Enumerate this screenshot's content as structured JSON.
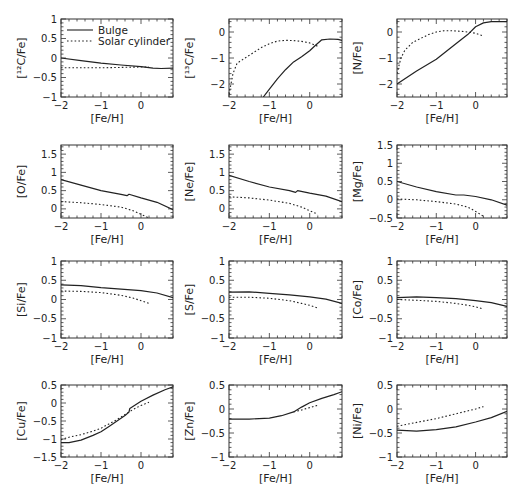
{
  "chart_data": {
    "type": "line",
    "layout": "4x3 grid of panels",
    "legend": {
      "placement": "top-left of first panel",
      "entries": [
        {
          "name": "Bulge",
          "style": "solid"
        },
        {
          "name": "Solar cylinder",
          "style": "dotted"
        }
      ]
    },
    "series_names": [
      "Bulge",
      "Solar cylinder"
    ],
    "panels": [
      {
        "id": "C12",
        "ylabel": "[¹²C/Fe]",
        "xlabel": "[Fe/H]",
        "xlim": [
          -2,
          0.8
        ],
        "ylim": [
          -1,
          1
        ],
        "xticks": [
          -2,
          -1,
          0
        ],
        "yticks": [
          -1,
          -0.5,
          0,
          0.5,
          1
        ],
        "ytick_labels": [
          "−1",
          "−0.5",
          "0",
          "0.5",
          "1"
        ],
        "has_legend": true,
        "series": [
          {
            "name": "Bulge",
            "x": [
              -2,
              -1.5,
              -1,
              -0.5,
              0,
              0.3,
              0.5,
              0.8
            ],
            "y": [
              0.0,
              -0.07,
              -0.13,
              -0.18,
              -0.22,
              -0.26,
              -0.27,
              -0.26
            ]
          },
          {
            "name": "Solar cylinder",
            "x": [
              -2,
              -1.5,
              -1,
              -0.5,
              0.0,
              0.2
            ],
            "y": [
              -0.25,
              -0.25,
              -0.25,
              -0.24,
              -0.23,
              -0.23
            ]
          }
        ]
      },
      {
        "id": "C13",
        "ylabel": "[¹³C/Fe]",
        "xlabel": "[Fe/H]",
        "xlim": [
          -2,
          0.8
        ],
        "ylim": [
          -2.5,
          0.5
        ],
        "xticks": [
          -2,
          -1,
          0
        ],
        "yticks": [
          -2,
          -1,
          0
        ],
        "ytick_labels": [
          "−2",
          "−1",
          "0"
        ],
        "series": [
          {
            "name": "Bulge",
            "x": [
              -1.15,
              -1.0,
              -0.8,
              -0.6,
              -0.4,
              -0.2,
              0.0,
              0.15,
              0.3,
              0.5,
              0.7,
              0.8
            ],
            "y": [
              -2.5,
              -2.2,
              -1.8,
              -1.45,
              -1.15,
              -0.95,
              -0.72,
              -0.5,
              -0.3,
              -0.27,
              -0.28,
              -0.32
            ]
          },
          {
            "name": "Solar cylinder",
            "x": [
              -2,
              -1.9,
              -1.8,
              -1.6,
              -1.4,
              -1.2,
              -1.0,
              -0.8,
              -0.6,
              -0.4,
              -0.2,
              0.0,
              0.2
            ],
            "y": [
              -2.4,
              -1.6,
              -1.2,
              -1.0,
              -0.8,
              -0.6,
              -0.45,
              -0.35,
              -0.32,
              -0.33,
              -0.36,
              -0.42,
              -0.55
            ]
          }
        ]
      },
      {
        "id": "N",
        "ylabel": "[N/Fe]",
        "xlabel": "[Fe/H]",
        "xlim": [
          -2,
          0.8
        ],
        "ylim": [
          -2.5,
          0.5
        ],
        "xticks": [
          -2,
          -1,
          0
        ],
        "yticks": [
          -2,
          -1,
          0
        ],
        "ytick_labels": [
          "−2",
          "−1",
          "0"
        ],
        "series": [
          {
            "name": "Bulge",
            "x": [
              -2,
              -1.5,
              -1.0,
              -0.5,
              -0.2,
              0.0,
              0.2,
              0.4,
              0.8
            ],
            "y": [
              -2.0,
              -1.5,
              -1.05,
              -0.45,
              -0.1,
              0.2,
              0.35,
              0.4,
              0.4
            ]
          },
          {
            "name": "Solar cylinder",
            "x": [
              -2,
              -1.9,
              -1.8,
              -1.6,
              -1.4,
              -1.2,
              -1.0,
              -0.8,
              -0.6,
              -0.4,
              -0.2,
              0.0,
              0.2
            ],
            "y": [
              -1.6,
              -1.0,
              -0.7,
              -0.4,
              -0.25,
              -0.1,
              0.0,
              0.05,
              0.05,
              0.03,
              0.0,
              -0.05,
              -0.15
            ]
          }
        ]
      },
      {
        "id": "O",
        "ylabel": "[O/Fe]",
        "xlabel": "[Fe/H]",
        "xlim": [
          -2,
          0.8
        ],
        "ylim": [
          -0.25,
          1.75
        ],
        "xticks": [
          -2,
          -1,
          0
        ],
        "yticks": [
          0,
          0.5,
          1,
          1.5
        ],
        "ytick_labels": [
          "0",
          "0.5",
          "1",
          "1.5"
        ],
        "series": [
          {
            "name": "Bulge",
            "x": [
              -2,
              -1.5,
              -1.0,
              -0.5,
              -0.35,
              -0.3,
              0.0,
              0.4,
              0.8
            ],
            "y": [
              0.8,
              0.65,
              0.5,
              0.4,
              0.36,
              0.4,
              0.3,
              0.18,
              -0.02
            ]
          },
          {
            "name": "Solar cylinder",
            "x": [
              -2,
              -1.5,
              -1.0,
              -0.5,
              -0.2,
              0.0,
              0.2
            ],
            "y": [
              0.2,
              0.17,
              0.12,
              0.05,
              -0.05,
              -0.15,
              -0.25
            ]
          }
        ]
      },
      {
        "id": "Ne",
        "ylabel": "[Ne/Fe]",
        "xlabel": "[Fe/H]",
        "xlim": [
          -2,
          0.8
        ],
        "ylim": [
          -0.25,
          1.75
        ],
        "xticks": [
          -2,
          -1,
          0
        ],
        "yticks": [
          0,
          0.5,
          1,
          1.5
        ],
        "ytick_labels": [
          "0",
          "0.5",
          "1",
          "1.5"
        ],
        "series": [
          {
            "name": "Bulge",
            "x": [
              -2,
              -1.5,
              -1.0,
              -0.5,
              -0.35,
              -0.3,
              0.0,
              0.4,
              0.8
            ],
            "y": [
              0.92,
              0.75,
              0.6,
              0.5,
              0.45,
              0.5,
              0.43,
              0.35,
              0.2
            ]
          },
          {
            "name": "Solar cylinder",
            "x": [
              -2,
              -1.5,
              -1.0,
              -0.5,
              -0.2,
              0.0,
              0.2
            ],
            "y": [
              0.33,
              0.3,
              0.24,
              0.15,
              0.05,
              -0.05,
              -0.15
            ]
          }
        ]
      },
      {
        "id": "Mg",
        "ylabel": "[Mg/Fe]",
        "xlabel": "[Fe/H]",
        "xlim": [
          -2,
          0.8
        ],
        "ylim": [
          -0.5,
          1.5
        ],
        "xticks": [
          -2,
          -1,
          0
        ],
        "yticks": [
          -0.5,
          0,
          0.5,
          1,
          1.5
        ],
        "ytick_labels": [
          "−0.5",
          "0",
          "0.5",
          "1",
          "1.5"
        ],
        "series": [
          {
            "name": "Bulge",
            "x": [
              -2,
              -1.5,
              -1.0,
              -0.5,
              -0.3,
              0.0,
              0.4,
              0.8
            ],
            "y": [
              0.5,
              0.35,
              0.22,
              0.13,
              0.13,
              0.09,
              0.0,
              -0.15
            ]
          },
          {
            "name": "Solar cylinder",
            "x": [
              -2,
              -1.5,
              -1.0,
              -0.5,
              -0.2,
              0.0,
              0.2
            ],
            "y": [
              0.02,
              0.0,
              -0.05,
              -0.12,
              -0.2,
              -0.32,
              -0.45
            ]
          }
        ]
      },
      {
        "id": "Si",
        "ylabel": "[Si/Fe]",
        "xlabel": "[Fe/H]",
        "xlim": [
          -2,
          0.8
        ],
        "ylim": [
          -1,
          1
        ],
        "xticks": [
          -2,
          -1,
          0
        ],
        "yticks": [
          -1,
          -0.5,
          0,
          0.5,
          1
        ],
        "ytick_labels": [
          "−1",
          "−0.5",
          "0",
          "0.5",
          "1"
        ],
        "series": [
          {
            "name": "Bulge",
            "x": [
              -2,
              -1.5,
              -1.0,
              -0.5,
              0.0,
              0.4,
              0.8
            ],
            "y": [
              0.38,
              0.36,
              0.31,
              0.27,
              0.23,
              0.17,
              0.05
            ]
          },
          {
            "name": "Solar cylinder",
            "x": [
              -2,
              -1.5,
              -1.0,
              -0.5,
              -0.2,
              0.0,
              0.2
            ],
            "y": [
              0.22,
              0.21,
              0.18,
              0.11,
              0.04,
              -0.03,
              -0.1
            ]
          }
        ]
      },
      {
        "id": "S",
        "ylabel": "[S/Fe]",
        "xlabel": "[Fe/H]",
        "xlim": [
          -2,
          0.8
        ],
        "ylim": [
          -1,
          1
        ],
        "xticks": [
          -2,
          -1,
          0
        ],
        "yticks": [
          -1,
          -0.5,
          0,
          0.5,
          1
        ],
        "ytick_labels": [
          "−1",
          "−0.5",
          "0",
          "0.5",
          "1"
        ],
        "series": [
          {
            "name": "Bulge",
            "x": [
              -2,
              -1.5,
              -1.0,
              -0.5,
              0.0,
              0.4,
              0.8
            ],
            "y": [
              0.19,
              0.2,
              0.16,
              0.12,
              0.07,
              0.01,
              -0.1
            ]
          },
          {
            "name": "Solar cylinder",
            "x": [
              -2,
              -1.5,
              -1.0,
              -0.5,
              -0.2,
              0.0,
              0.2
            ],
            "y": [
              0.06,
              0.06,
              0.03,
              -0.03,
              -0.1,
              -0.15,
              -0.22
            ]
          }
        ]
      },
      {
        "id": "Co",
        "ylabel": "[Co/Fe]",
        "xlabel": "[Fe/H]",
        "xlim": [
          -2,
          0.8
        ],
        "ylim": [
          -1,
          1
        ],
        "xticks": [
          -2,
          -1,
          0
        ],
        "yticks": [
          -1,
          -0.5,
          0,
          0.5,
          1
        ],
        "ytick_labels": [
          "−1",
          "−0.5",
          "0",
          "0.5",
          "1"
        ],
        "series": [
          {
            "name": "Bulge",
            "x": [
              -2,
              -1.5,
              -1.0,
              -0.5,
              0.0,
              0.4,
              0.8
            ],
            "y": [
              0.05,
              0.07,
              0.05,
              0.02,
              -0.03,
              -0.08,
              -0.18
            ]
          },
          {
            "name": "Solar cylinder",
            "x": [
              -2,
              -1.5,
              -1.0,
              -0.5,
              -0.2,
              0.0,
              0.2
            ],
            "y": [
              0.0,
              -0.02,
              -0.05,
              -0.1,
              -0.15,
              -0.19,
              -0.25
            ]
          }
        ]
      },
      {
        "id": "Cu",
        "ylabel": "[Cu/Fe]",
        "xlabel": "[Fe/H]",
        "xlim": [
          -2,
          0.8
        ],
        "ylim": [
          -1.5,
          0.5
        ],
        "xticks": [
          -2,
          -1,
          0
        ],
        "yticks": [
          -1.5,
          -1,
          -0.5,
          0,
          0.5
        ],
        "ytick_labels": [
          "−1.5",
          "−1",
          "−0.5",
          "0",
          "0.5"
        ],
        "series": [
          {
            "name": "Bulge",
            "x": [
              -2,
              -1.8,
              -1.5,
              -1.2,
              -1.0,
              -0.8,
              -0.6,
              -0.4,
              -0.3,
              -0.28,
              0.0,
              0.3,
              0.6,
              0.8
            ],
            "y": [
              -1.1,
              -1.1,
              -1.03,
              -0.9,
              -0.8,
              -0.65,
              -0.5,
              -0.35,
              -0.25,
              -0.15,
              0.05,
              0.22,
              0.37,
              0.45
            ]
          },
          {
            "name": "Solar cylinder",
            "x": [
              -2,
              -1.8,
              -1.5,
              -1.2,
              -1.0,
              -0.8,
              -0.6,
              -0.4,
              -0.2,
              0.0,
              0.2
            ],
            "y": [
              -1.02,
              -0.95,
              -0.88,
              -0.78,
              -0.7,
              -0.58,
              -0.46,
              -0.32,
              -0.18,
              -0.07,
              0.02
            ]
          }
        ]
      },
      {
        "id": "Zn",
        "ylabel": "[Zn/Fe]",
        "xlabel": "[Fe/H]",
        "xlim": [
          -2,
          0.8
        ],
        "ylim": [
          -1,
          0.5
        ],
        "xticks": [
          -2,
          -1,
          0
        ],
        "yticks": [
          -1,
          -0.5,
          0,
          0.5
        ],
        "ytick_labels": [
          "−1",
          "−0.5",
          "0",
          "0.5"
        ],
        "series": [
          {
            "name": "Bulge",
            "x": [
              -2,
              -1.5,
              -1.0,
              -0.7,
              -0.4,
              -0.2,
              0.0,
              0.3,
              0.6,
              0.8
            ],
            "y": [
              -0.21,
              -0.21,
              -0.19,
              -0.14,
              -0.06,
              0.04,
              0.13,
              0.22,
              0.3,
              0.36
            ]
          },
          {
            "name": "Solar cylinder",
            "x": [
              -0.4,
              -0.2,
              0.0,
              0.2
            ],
            "y": [
              -0.06,
              -0.02,
              0.03,
              0.08
            ]
          }
        ]
      },
      {
        "id": "Ni",
        "ylabel": "[Ni/Fe]",
        "xlabel": "[Fe/H]",
        "xlim": [
          -2,
          0.8
        ],
        "ylim": [
          -1,
          0.5
        ],
        "xticks": [
          -2,
          -1,
          0
        ],
        "yticks": [
          -1,
          -0.5,
          0,
          0.5
        ],
        "ytick_labels": [
          "−1",
          "−0.5",
          "0",
          "0.5"
        ],
        "series": [
          {
            "name": "Bulge",
            "x": [
              -2,
              -1.5,
              -1.0,
              -0.5,
              0.0,
              0.4,
              0.8
            ],
            "y": [
              -0.44,
              -0.46,
              -0.43,
              -0.37,
              -0.27,
              -0.18,
              -0.05
            ]
          },
          {
            "name": "Solar cylinder",
            "x": [
              -2,
              -1.5,
              -1.0,
              -0.5,
              0.0,
              0.2
            ],
            "y": [
              -0.36,
              -0.28,
              -0.2,
              -0.1,
              0.0,
              0.05
            ]
          }
        ]
      }
    ]
  }
}
